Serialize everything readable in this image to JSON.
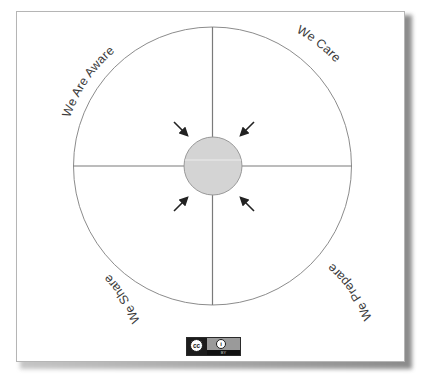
{
  "diagram": {
    "type": "quadrant-circle",
    "quadrants": [
      {
        "position": "top-left",
        "label": "We Are Aware"
      },
      {
        "position": "top-right",
        "label": "We Care"
      },
      {
        "position": "bottom-right",
        "label": "We Prepare"
      },
      {
        "position": "bottom-left",
        "label": "We Share"
      }
    ],
    "center": {
      "shape": "circle",
      "fill": "#d4d4d4",
      "label": ""
    },
    "arrows": {
      "count": 4,
      "direction": "inward-to-center",
      "color": "#222222"
    },
    "outline_color": "#8c8c8c",
    "divider_color": "#7a7a7a"
  },
  "license_badge": {
    "left_icon": "creative-commons-icon",
    "left_text": "cc",
    "right_icon": "attribution-person-icon",
    "right_text": "BY"
  }
}
